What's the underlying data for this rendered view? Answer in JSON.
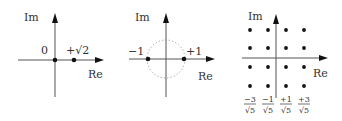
{
  "figure": {
    "panels": [
      {
        "id": "bpsk-sqrt2",
        "axes": {
          "x_label": "Re",
          "y_label": "Im"
        },
        "labels": {
          "origin": "0",
          "point": "+√2"
        },
        "points": [
          {
            "re": 0,
            "im": 0
          },
          {
            "re": 1.414,
            "im": 0
          }
        ]
      },
      {
        "id": "bpsk-unit-circle",
        "axes": {
          "x_label": "Re",
          "y_label": "Im"
        },
        "labels": {
          "left": "−1",
          "right": "+1"
        },
        "unit_circle": "dotted",
        "points": [
          {
            "re": -1,
            "im": 0
          },
          {
            "re": 1,
            "im": 0
          }
        ]
      },
      {
        "id": "16qam",
        "axes": {
          "x_label": "Re",
          "y_label": "Im"
        },
        "tick_labels": [
          {
            "num": "−3",
            "den": "√5"
          },
          {
            "num": "−1",
            "den": "√5"
          },
          {
            "num": "+1",
            "den": "√5"
          },
          {
            "num": "+3",
            "den": "√5"
          }
        ],
        "grid": "4x4"
      }
    ]
  }
}
